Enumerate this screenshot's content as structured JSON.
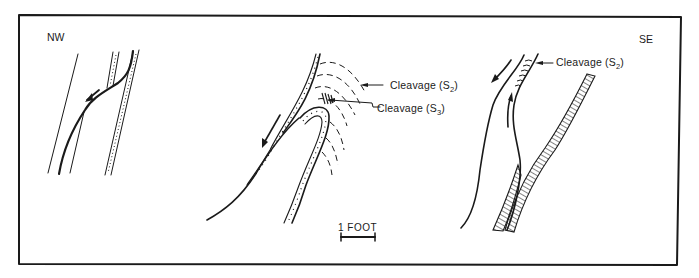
{
  "figure": {
    "orientation": {
      "left": "NW",
      "right": "SE"
    },
    "annotations": {
      "center_s2": {
        "text": "Cleavage (S",
        "sub": "2",
        "close": ")"
      },
      "center_s3": {
        "text": "Cleavage (S",
        "sub": "3",
        "close": ")"
      },
      "right_s2": {
        "text": "Cleavage (S",
        "sub": "2",
        "close": ")"
      }
    },
    "scale_bar": {
      "label": "1 FOOT"
    },
    "panels": [
      {
        "id": "nw",
        "description": "Thin fault offsetting dotted marker bed, with slip arrow"
      },
      {
        "id": "center",
        "description": "Tight fold of dotted bed with S2 dashed cleavage arcs and S3 crenulation at hinge"
      },
      {
        "id": "se",
        "description": "Curved fault between hatched beds with opposing slip arrows and S2 cleavage"
      }
    ],
    "colors": {
      "ink": "#1a1a1a",
      "background": "#ffffff"
    }
  }
}
